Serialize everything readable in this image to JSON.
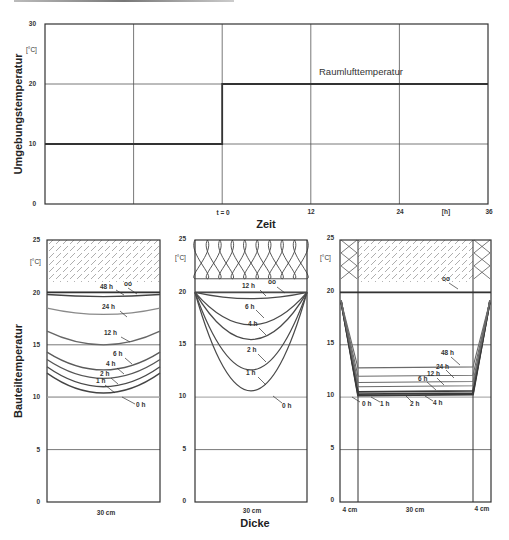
{
  "top_chart": {
    "ylabel": "Umgebungstemperatur",
    "unit": "[°C]",
    "xlabel": "Zeit",
    "x_unit": "[h]",
    "annotation": "Raumlufttemperatur",
    "y_ticks": [
      "0",
      "10",
      "20",
      "30"
    ],
    "x_ticks": [
      "t = 0",
      "12",
      "24",
      "36"
    ]
  },
  "bottom_charts": {
    "ylabel": "Bauteiltemperatur",
    "xlabel": "Dicke",
    "unit": "[°C]",
    "y_ticks": [
      "0",
      "5",
      "10",
      "15",
      "20",
      "25"
    ],
    "panel_a": {
      "width_label": "30 cm",
      "infinity_label": "∞"
    },
    "panel_b": {
      "width_label": "30 cm",
      "infinity_label": "∞"
    },
    "panel_c": {
      "width_labels": [
        "4 cm",
        "30 cm",
        "4 cm"
      ],
      "infinity_label": "∞"
    }
  },
  "colors": {
    "axis": "#333333",
    "grid": "#555555",
    "curve_dark": "#3a3a3a",
    "curve_mid": "#666666",
    "curve_light": "#9a9a9a",
    "zero_line": "#b0b0b0"
  },
  "chart_data": [
    {
      "type": "line",
      "title": "",
      "xlabel": "Zeit [h]",
      "ylabel": "Umgebungstemperatur [°C]",
      "xlim": [
        -24,
        36
      ],
      "ylim": [
        0,
        30
      ],
      "grid": true,
      "series": [
        {
          "name": "Raumlufttemperatur",
          "x": [
            -24,
            0,
            0,
            36
          ],
          "y": [
            10,
            10,
            20,
            20
          ]
        }
      ]
    },
    {
      "type": "line",
      "title": "Massive Wand 30 cm (innen & außen beheizt)",
      "xlabel": "Dicke (30 cm)",
      "ylabel": "Bauteiltemperatur [°C]",
      "ylim": [
        0,
        25
      ],
      "grid": true,
      "series": [
        {
          "name": "0 h",
          "edge": 10,
          "center": 10
        },
        {
          "name": "1 h",
          "edge": 12.3,
          "center": 10.4
        },
        {
          "name": "2 h",
          "edge": 12.9,
          "center": 11.0
        },
        {
          "name": "4 h",
          "edge": 13.6,
          "center": 11.8
        },
        {
          "name": "6 h",
          "edge": 14.3,
          "center": 12.6
        },
        {
          "name": "12 h",
          "edge": 16.3,
          "center": 15.0
        },
        {
          "name": "24 h",
          "edge": 18.5,
          "center": 17.9
        },
        {
          "name": "48 h",
          "edge": 19.8,
          "center": 19.6
        },
        {
          "name": "∞",
          "edge": 20,
          "center": 20
        }
      ]
    },
    {
      "type": "line",
      "title": "Gedämmte Wand 30 cm",
      "xlabel": "Dicke (30 cm)",
      "ylabel": "Bauteiltemperatur [°C]",
      "ylim": [
        0,
        25
      ],
      "grid": true,
      "series": [
        {
          "name": "0 h",
          "edge": 10,
          "center": 10
        },
        {
          "name": "1 h",
          "edge": 20,
          "center": 10.6
        },
        {
          "name": "2 h",
          "edge": 20,
          "center": 12.6
        },
        {
          "name": "4 h",
          "edge": 20,
          "center": 15.5
        },
        {
          "name": "6 h",
          "edge": 20,
          "center": 16.9
        },
        {
          "name": "12 h",
          "edge": 20,
          "center": 19.4
        },
        {
          "name": "∞",
          "edge": 20,
          "center": 20
        }
      ]
    },
    {
      "type": "line",
      "title": "Kerndämmung 4 cm / 30 cm / 4 cm",
      "xlabel": "Dicke (4 cm | 30 cm | 4 cm)",
      "ylabel": "Bauteiltemperatur [°C]",
      "ylim": [
        0,
        25
      ],
      "grid": true,
      "series": [
        {
          "name": "0 h",
          "core": 10
        },
        {
          "name": "1 h",
          "core": 10.15
        },
        {
          "name": "2 h",
          "core": 10.3
        },
        {
          "name": "4 h",
          "core": 10.5
        },
        {
          "name": "6 h",
          "core": 11.0
        },
        {
          "name": "12 h",
          "core": 11.4
        },
        {
          "name": "24 h",
          "core": 12.0
        },
        {
          "name": "48 h",
          "core": 12.8
        },
        {
          "name": "∞",
          "core": 20
        }
      ]
    }
  ]
}
